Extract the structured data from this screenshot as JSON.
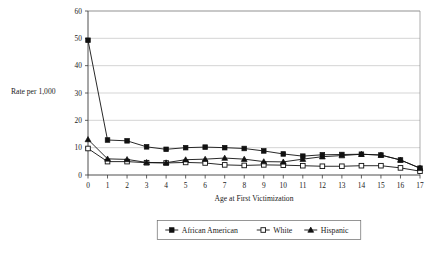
{
  "chart_data": {
    "type": "line",
    "title": "",
    "xlabel": "Age at First Victimization",
    "ylabel": "Rate per 1,000",
    "categories": [
      0,
      1,
      2,
      3,
      4,
      5,
      6,
      7,
      8,
      9,
      10,
      11,
      12,
      13,
      14,
      15,
      16,
      17
    ],
    "x_tick_labels": [
      "0",
      "1",
      "2",
      "3",
      "4",
      "5",
      "6",
      "7",
      "8",
      "9",
      "10",
      "11",
      "12",
      "13",
      "14",
      "15",
      "16",
      "17"
    ],
    "y_tick_labels": [
      "0",
      "10",
      "20",
      "30",
      "40",
      "50",
      "60"
    ],
    "y_ticks": [
      0,
      10,
      20,
      30,
      40,
      50,
      60
    ],
    "ylim": [
      0,
      60
    ],
    "xlim": [
      0,
      17
    ],
    "grid": "horizontal",
    "legend_position": "bottom",
    "series": [
      {
        "name": "African American",
        "marker": "filled-square",
        "color": "#111111",
        "values": [
          49.3,
          12.8,
          12.5,
          10.3,
          9.4,
          10.0,
          10.2,
          10.0,
          9.7,
          8.8,
          7.7,
          6.9,
          7.4,
          7.5,
          7.6,
          7.3,
          5.5,
          2.5
        ]
      },
      {
        "name": "White",
        "marker": "open-square",
        "color": "#111111",
        "values": [
          9.7,
          4.9,
          4.9,
          4.5,
          4.4,
          4.6,
          4.4,
          3.7,
          3.5,
          3.7,
          3.6,
          3.4,
          3.2,
          3.2,
          3.4,
          3.4,
          2.6,
          1.4
        ]
      },
      {
        "name": "Hispanic",
        "marker": "filled-triangle",
        "color": "#111111",
        "values": [
          13.0,
          5.9,
          5.7,
          4.6,
          4.5,
          5.6,
          5.8,
          6.2,
          5.8,
          4.9,
          4.8,
          5.8,
          6.7,
          7.1,
          7.6,
          7.3,
          5.5,
          2.5
        ]
      }
    ]
  },
  "legend": {
    "items": [
      {
        "label": "African American",
        "marker": "filled-square"
      },
      {
        "label": "White",
        "marker": "open-square"
      },
      {
        "label": "Hispanic",
        "marker": "filled-triangle"
      }
    ]
  },
  "axes": {
    "y_title": "Rate per 1,000",
    "x_title": "Age at First Victimization"
  }
}
